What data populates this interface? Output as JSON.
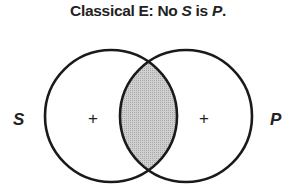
{
  "title": {
    "prefix": "Classical E:  No ",
    "subject": "S",
    "middle": " is ",
    "predicate": "P",
    "suffix": "."
  },
  "diagram": {
    "type": "venn",
    "circles": [
      {
        "label": "S",
        "region_mark": "+"
      },
      {
        "label": "P",
        "region_mark": "+"
      }
    ],
    "intersection": {
      "shaded": true,
      "fill": "#c8c8c8"
    },
    "stroke_color": "#1a1a1a"
  }
}
